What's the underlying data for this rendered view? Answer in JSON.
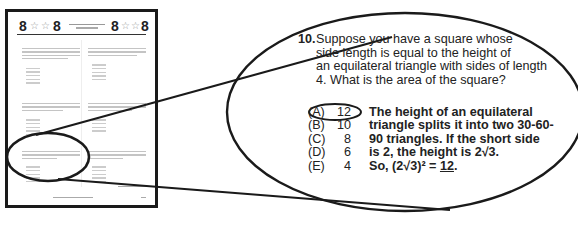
{
  "thumbnail_page": {
    "header_left": [
      "8",
      "☆",
      "☆",
      "8"
    ],
    "header_right": [
      "8",
      "☆",
      "☆",
      "8"
    ],
    "questions_count": 6
  },
  "callout": {
    "question_number": "10.",
    "question_lines": [
      "Suppose you have a square whose",
      "side length is equal to the height of",
      "an equilateral triangle with sides of length",
      "4.  What is the area of the square?"
    ],
    "choices": [
      {
        "letter": "(A)",
        "value": "12",
        "circled": true
      },
      {
        "letter": "(B)",
        "value": "10",
        "circled": false
      },
      {
        "letter": "(C)",
        "value": "8",
        "circled": false
      },
      {
        "letter": "(D)",
        "value": "6",
        "circled": false
      },
      {
        "letter": "(E)",
        "value": "4",
        "circled": false
      }
    ],
    "explanation_lines": [
      "The height of an equilateral",
      "triangle splits it into two 30-60-",
      "90 triangles.  If the short side",
      "is 2, the height is 2√3."
    ],
    "final_line_prefix": "So, (2√3)² = ",
    "final_answer": "12",
    "final_line_suffix": "."
  },
  "colors": {
    "ink": "#1a1a1a",
    "text": "#222222",
    "placeholder": "#c4c4c4"
  }
}
